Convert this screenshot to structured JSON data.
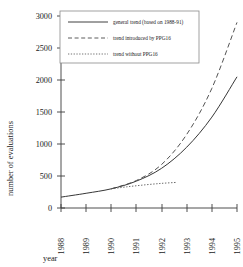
{
  "chart_data": {
    "type": "line",
    "title": "",
    "xlabel": "year",
    "ylabel": "number of evaluations",
    "grid": false,
    "legend_position": "top-center",
    "x": [
      1988,
      1989,
      1990,
      1991,
      1992,
      1993,
      1994,
      1995
    ],
    "xlim": [
      1988,
      1995
    ],
    "ylim": [
      0,
      3000
    ],
    "yticks": [
      0,
      500,
      1000,
      1500,
      2000,
      2500,
      3000
    ],
    "xticks": [
      "1988",
      "1989",
      "1990",
      "1991",
      "1992",
      "1993",
      "1994",
      "1995"
    ],
    "series": [
      {
        "name": "general trend (based on 1988-91)",
        "style": "solid",
        "color": "#2b2b2b",
        "x": [
          1988,
          1989,
          1990,
          1991,
          1992,
          1993,
          1994,
          1995
        ],
        "values": [
          170,
          230,
          300,
          420,
          620,
          950,
          1420,
          2050
        ]
      },
      {
        "name": "trend introduced by PPG16",
        "style": "dashed",
        "color": "#4a4a4a",
        "x": [
          1990,
          1991,
          1992,
          1993,
          1994,
          1995
        ],
        "values": [
          300,
          430,
          680,
          1150,
          1870,
          2900
        ]
      },
      {
        "name": "trend without PPG16",
        "style": "dotted",
        "color": "#5a5a5a",
        "x": [
          1990,
          1990.6,
          1991.3,
          1992,
          1992.6
        ],
        "values": [
          300,
          330,
          360,
          385,
          400
        ]
      }
    ]
  },
  "legend": {
    "items": [
      {
        "label": "general trend (based on 1988-91)",
        "style": "solid"
      },
      {
        "label": "trend introduced by PPG16",
        "style": "dashed"
      },
      {
        "label": "trend without PPG16",
        "style": "dotted"
      }
    ]
  },
  "axes": {
    "y_title": "number of evaluations",
    "x_title": "year",
    "y_ticks": [
      "3000",
      "2500",
      "2000",
      "1500",
      "1000",
      "500",
      "0"
    ],
    "x_ticks": [
      "1988",
      "1989",
      "1990",
      "1991",
      "1992",
      "1993",
      "1994",
      "1995"
    ]
  }
}
